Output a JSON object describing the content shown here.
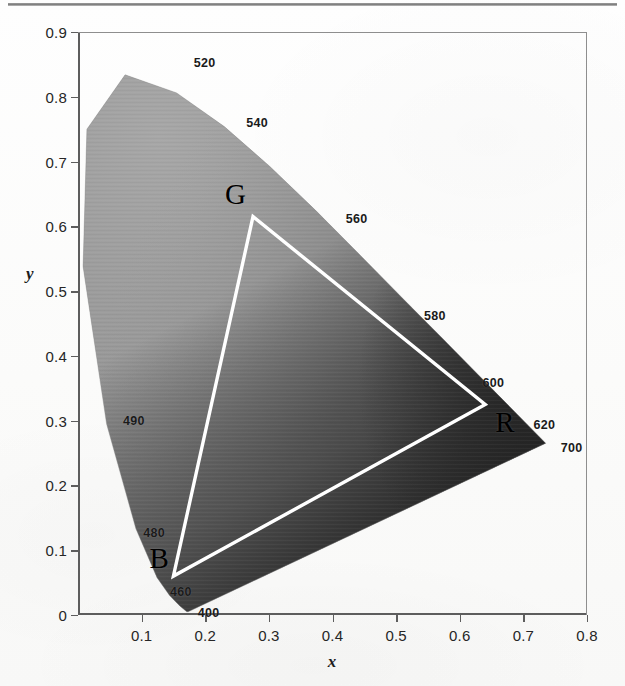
{
  "figure": {
    "type": "cie-chromaticity-diagram",
    "top_rule": "horizontal-rule"
  },
  "axes": {
    "x_title": "x",
    "y_title": "y",
    "x_ticks": [
      "0",
      "0.1",
      "0.2",
      "0.3",
      "0.4",
      "0.5",
      "0.6",
      "0.7",
      "0.8"
    ],
    "y_ticks": [
      "0",
      "0.1",
      "0.2",
      "0.3",
      "0.4",
      "0.5",
      "0.6",
      "0.7",
      "0.8",
      "0.9"
    ]
  },
  "vertices": [
    {
      "label": "G",
      "x": 0.275,
      "y": 0.615
    },
    {
      "label": "R",
      "x": 0.64,
      "y": 0.325
    },
    {
      "label": "B",
      "x": 0.15,
      "y": 0.06
    }
  ],
  "wavelengths": [
    {
      "label": "520",
      "x": 0.185,
      "y": 0.838
    },
    {
      "label": "540",
      "x": 0.258,
      "y": 0.752
    },
    {
      "label": "560",
      "x": 0.405,
      "y": 0.613
    },
    {
      "label": "580",
      "x": 0.525,
      "y": 0.47
    },
    {
      "label": "600",
      "x": 0.62,
      "y": 0.363
    },
    {
      "label": "620",
      "x": 0.7,
      "y": 0.298
    },
    {
      "label": "700",
      "x": 0.743,
      "y": 0.262
    },
    {
      "label": "490",
      "x": 0.055,
      "y": 0.3
    },
    {
      "label": "480",
      "x": 0.09,
      "y": 0.125
    },
    {
      "label": "460",
      "x": 0.135,
      "y": 0.035
    },
    {
      "label": "400",
      "x": 0.182,
      "y": 0.005
    }
  ],
  "chart_data": {
    "type": "scatter",
    "title": "",
    "xlabel": "x",
    "ylabel": "y",
    "xlim": [
      0,
      0.8
    ],
    "ylim": [
      0,
      0.9
    ],
    "grid": false,
    "legend": "none",
    "colorspace_triangle": {
      "name": "RGB gamut triangle",
      "stroke": "#ffffff",
      "points": [
        {
          "name": "G",
          "x": 0.275,
          "y": 0.615
        },
        {
          "name": "R",
          "x": 0.64,
          "y": 0.325
        },
        {
          "name": "B",
          "x": 0.15,
          "y": 0.06
        }
      ]
    },
    "spectral_locus": {
      "name": "CIE 1931 spectral locus (grayscale fill)",
      "wavelength_labels_nm": [
        400,
        460,
        480,
        490,
        520,
        540,
        560,
        580,
        600,
        620,
        700
      ],
      "points": [
        {
          "wl": 400,
          "x": 0.173,
          "y": 0.005
        },
        {
          "wl": 420,
          "x": 0.171,
          "y": 0.005
        },
        {
          "wl": 440,
          "x": 0.16,
          "y": 0.014
        },
        {
          "wl": 460,
          "x": 0.144,
          "y": 0.03
        },
        {
          "wl": 470,
          "x": 0.124,
          "y": 0.058
        },
        {
          "wl": 480,
          "x": 0.091,
          "y": 0.133
        },
        {
          "wl": 490,
          "x": 0.045,
          "y": 0.295
        },
        {
          "wl": 500,
          "x": 0.008,
          "y": 0.538
        },
        {
          "wl": 510,
          "x": 0.014,
          "y": 0.75
        },
        {
          "wl": 520,
          "x": 0.074,
          "y": 0.834
        },
        {
          "wl": 530,
          "x": 0.155,
          "y": 0.806
        },
        {
          "wl": 540,
          "x": 0.23,
          "y": 0.754
        },
        {
          "wl": 550,
          "x": 0.302,
          "y": 0.692
        },
        {
          "wl": 560,
          "x": 0.373,
          "y": 0.625
        },
        {
          "wl": 570,
          "x": 0.444,
          "y": 0.555
        },
        {
          "wl": 580,
          "x": 0.512,
          "y": 0.487
        },
        {
          "wl": 590,
          "x": 0.575,
          "y": 0.425
        },
        {
          "wl": 600,
          "x": 0.627,
          "y": 0.373
        },
        {
          "wl": 610,
          "x": 0.666,
          "y": 0.334
        },
        {
          "wl": 620,
          "x": 0.692,
          "y": 0.308
        },
        {
          "wl": 640,
          "x": 0.719,
          "y": 0.281
        },
        {
          "wl": 700,
          "x": 0.735,
          "y": 0.265
        }
      ]
    },
    "colors": {
      "fill_light": "#9a9a9a",
      "fill_dark": "#303030",
      "triangle_stroke": "#ffffff",
      "axis": "#5d5d5d",
      "text": "#1a1a1a",
      "background": "#fdfdfc"
    }
  }
}
